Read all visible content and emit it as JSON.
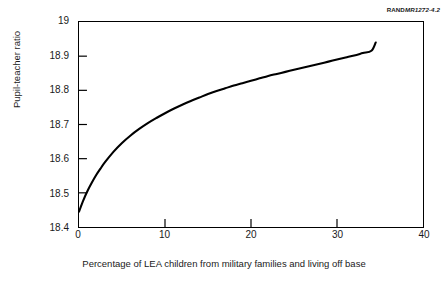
{
  "source_line": {
    "brand": "RAND",
    "document_number": "MR1272-4.2",
    "full": "RANDMR1272-4.2"
  },
  "chart_data": {
    "type": "line",
    "title": "",
    "subtitle": "",
    "xlabel": "Percentage of LEA children from military families and living off base",
    "ylabel": "Pupil-teacher ratio",
    "xlim": [
      0,
      40
    ],
    "ylim": [
      18.4,
      19
    ],
    "xticks": [
      0,
      10,
      20,
      30,
      40
    ],
    "xtick_labels": [
      "0",
      "10",
      "20",
      "30",
      "40"
    ],
    "yticks": [
      18.4,
      18.5,
      18.6,
      18.7,
      18.8,
      18.9,
      19
    ],
    "ytick_labels": [
      "18.4",
      "18.5",
      "18.6",
      "18.7",
      "18.8",
      "18.9",
      "19"
    ],
    "grid": false,
    "legend": false,
    "legend_position": "none",
    "line_color": "#000000",
    "line_width": 2.1,
    "series": [
      {
        "name": "Pupil-teacher ratio",
        "x": [
          0,
          0.5,
          1,
          1.5,
          2,
          2.5,
          3,
          4,
          5,
          6,
          7,
          8,
          9,
          10,
          11,
          12,
          13,
          14,
          15,
          16,
          17,
          18,
          19,
          20,
          21,
          22,
          23,
          24,
          25,
          26,
          27,
          28,
          29,
          30,
          31,
          32,
          33,
          34,
          34.5
        ],
        "y": [
          18.445,
          18.478,
          18.506,
          18.53,
          18.552,
          18.571,
          18.589,
          18.62,
          18.646,
          18.668,
          18.687,
          18.704,
          18.719,
          18.733,
          18.746,
          18.758,
          18.769,
          18.779,
          18.789,
          18.798,
          18.806,
          18.814,
          18.821,
          18.828,
          18.835,
          18.842,
          18.848,
          18.854,
          18.86,
          18.866,
          18.872,
          18.878,
          18.884,
          18.89,
          18.896,
          18.902,
          18.909,
          18.916,
          18.94
        ]
      }
    ]
  }
}
